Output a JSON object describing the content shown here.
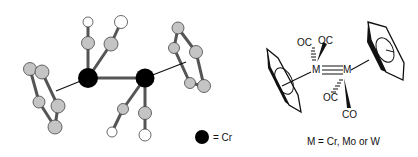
{
  "ball_and_stick": {
    "legend_label": "= Cr",
    "atom_colors": {
      "metal": "#000000",
      "carbon": "#c4c4c4",
      "oxygen": "#ffffff",
      "bond": "#333333"
    }
  },
  "structure": {
    "metal_left": "M",
    "metal_right": "M",
    "ligands": [
      "OC",
      "OC",
      "OC",
      "CO"
    ],
    "caption": "M = Cr, Mo or W"
  }
}
